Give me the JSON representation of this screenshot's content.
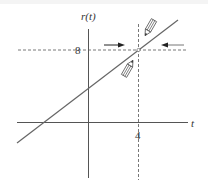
{
  "diagram": {
    "y_axis_label": "r(t)",
    "x_axis_label": "t",
    "y_tick_label": "8",
    "x_tick_label": "4",
    "line_color": "#666666",
    "axis_color": "#555555",
    "dash_color": "#555555",
    "arrow_color": "#222222",
    "annotations": [
      {
        "type": "arrow",
        "direction": "right",
        "meaning": "approach from left"
      },
      {
        "type": "arrow",
        "direction": "left",
        "meaning": "approach from right"
      },
      {
        "type": "pencil-icon",
        "position": "above-right of point",
        "pointing": "down-left"
      },
      {
        "type": "pencil-icon",
        "position": "below-left of point",
        "pointing": "up-right"
      }
    ],
    "point": {
      "t": 4,
      "r": 8
    }
  }
}
